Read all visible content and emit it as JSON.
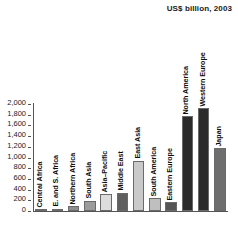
{
  "chart_data": {
    "type": "bar",
    "title": "US$ billion, 2003",
    "xlabel": "",
    "ylabel": "",
    "ylim": [
      0,
      2000
    ],
    "yticks": [
      "0",
      "200",
      "400",
      "600",
      "800",
      "1,000",
      "1,200",
      "1,400",
      "1,600",
      "1,800",
      "2,000"
    ],
    "ytick_values": [
      0,
      200,
      400,
      600,
      800,
      1000,
      1200,
      1400,
      1600,
      1800,
      2000
    ],
    "grid": false,
    "legend": "none",
    "categories": [
      "Central Africa",
      "E. and S. Africa",
      "Northern Africa",
      "South Asia",
      "Asia–Pacific",
      "Middle East",
      "East Asia",
      "South America",
      "Eastern Europe",
      "North America",
      "Western Europe",
      "Japan"
    ],
    "values": [
      10,
      45,
      85,
      190,
      310,
      340,
      940,
      235,
      160,
      1770,
      1920,
      1170
    ],
    "bar_colors": [
      "#9a9a9a",
      "#7d7d7d",
      "#8e8e8e",
      "#9c9c9c",
      "#dcdcdc",
      "#5f5f5f",
      "#c9c9c9",
      "#bfbfbf",
      "#555555",
      "#2b2b2b",
      "#2b2b2b",
      "#6e6e6e"
    ]
  }
}
